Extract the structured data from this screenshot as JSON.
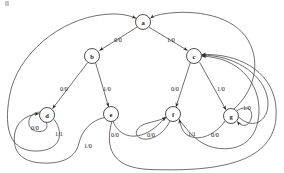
{
  "diagram": {
    "type": "mealy-state-machine",
    "title": "",
    "notation": "input/output",
    "states": [
      {
        "id": "a",
        "label": "a",
        "cx": 143,
        "cy": 22,
        "r": 7.5
      },
      {
        "id": "b",
        "label": "b",
        "cx": 92,
        "cy": 56,
        "r": 7.5
      },
      {
        "id": "c",
        "label": "c",
        "cx": 194,
        "cy": 56,
        "r": 7.5
      },
      {
        "id": "d",
        "label": "d",
        "cx": 47,
        "cy": 115,
        "r": 7.5
      },
      {
        "id": "e",
        "label": "e",
        "cx": 111,
        "cy": 114,
        "r": 7.5
      },
      {
        "id": "f",
        "label": "f",
        "cx": 173,
        "cy": 114,
        "r": 7.5
      },
      {
        "id": "g",
        "label": "g",
        "cx": 231,
        "cy": 116,
        "r": 7.5
      }
    ],
    "transitions": [
      {
        "from": "a",
        "to": "b",
        "label": "0/0",
        "lx": 118,
        "ly": 39
      },
      {
        "from": "a",
        "to": "c",
        "label": "1/0",
        "lx": 171,
        "ly": 39
      },
      {
        "from": "b",
        "to": "d",
        "label": "0/0",
        "lx": 64,
        "ly": 88
      },
      {
        "from": "b",
        "to": "e",
        "label": "1/0",
        "lx": 107,
        "ly": 88
      },
      {
        "from": "c",
        "to": "f",
        "label": "0/0",
        "lx": 175,
        "ly": 88
      },
      {
        "from": "c",
        "to": "g",
        "label": "1/0",
        "lx": 221,
        "ly": 88
      },
      {
        "from": "d",
        "to": "d",
        "label": "0/0",
        "lx": 35,
        "ly": 127
      },
      {
        "from": "d",
        "to": "a",
        "label": "1/1",
        "lx": 59,
        "ly": 133
      },
      {
        "from": "e",
        "to": "f",
        "label": "0/0",
        "lx": 115,
        "ly": 134
      },
      {
        "from": "e",
        "to": "d",
        "label": "1/0",
        "lx": 88,
        "ly": 145
      },
      {
        "from": "f",
        "to": "f",
        "label": "0/0",
        "lx": 151,
        "ly": 134
      },
      {
        "from": "f",
        "to": "c",
        "label": "1/1",
        "lx": 192,
        "ly": 133
      },
      {
        "from": "g",
        "to": "f",
        "label": "0/0",
        "lx": 215,
        "ly": 134
      },
      {
        "from": "g",
        "to": "g",
        "label": "1/0",
        "lx": 247,
        "ly": 107
      }
    ],
    "edge_labels": {
      "a_b": "0/0",
      "a_c": "1/0",
      "b_d": "0/0",
      "b_e": "1/0",
      "c_f": "0/0",
      "c_g": "1/0",
      "d_self": "0/0",
      "d_a": "1/1",
      "e_f": "0/0",
      "e_d": "1/0",
      "f_self": "0/0",
      "f_c": "1/1",
      "g_f": "0/0",
      "g_self": "1/0"
    },
    "colors": {
      "stroke": "#4a4a4a",
      "node_stroke": "#3d3d3d",
      "node_fill": "#ffffff",
      "text": "#161616",
      "background": "#ffffff"
    }
  }
}
